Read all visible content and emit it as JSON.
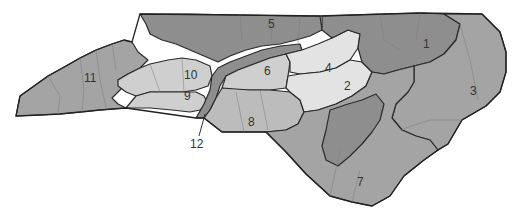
{
  "map": {
    "title": "North Carolina congressional districts",
    "colors": {
      "dark": "#8e8e8e",
      "medium": "#a4a4a4",
      "mid_light": "#bcbcbc",
      "light": "#cfcfcf",
      "very_light": "#e3e3e3",
      "border": "#2a2a2a",
      "background": "#ffffff"
    },
    "districts": [
      {
        "id": "1",
        "label": "1"
      },
      {
        "id": "2",
        "label": "2"
      },
      {
        "id": "3",
        "label": "3"
      },
      {
        "id": "4",
        "label": "4"
      },
      {
        "id": "5",
        "label": "5"
      },
      {
        "id": "6",
        "label": "6"
      },
      {
        "id": "7",
        "label": "7"
      },
      {
        "id": "8",
        "label": "8"
      },
      {
        "id": "9",
        "label": "9"
      },
      {
        "id": "10",
        "label": "10"
      },
      {
        "id": "11",
        "label": "11"
      },
      {
        "id": "12",
        "label": "12"
      }
    ]
  }
}
